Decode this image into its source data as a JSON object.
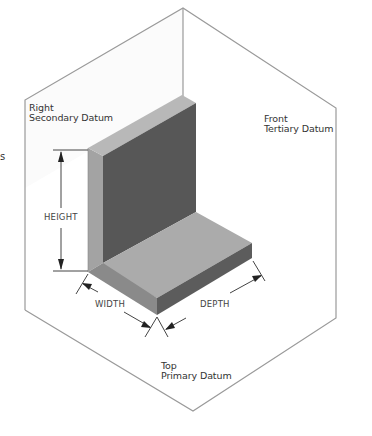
{
  "diagram": {
    "type": "isometric datum reference frame",
    "planes": [
      {
        "id": "right",
        "line1": "Right",
        "line2": "Secondary Datum"
      },
      {
        "id": "front",
        "line1": "Front",
        "line2": "Tertiary Datum"
      },
      {
        "id": "top",
        "line1": "Top",
        "line2": "Primary Datum"
      }
    ],
    "dimensions": {
      "height": "HEIGHT",
      "width": "WIDTH",
      "depth": "DEPTH"
    },
    "edge_fragment": "s",
    "colors": {
      "frame_line": "#9a9a9a",
      "top_face": "#b4b4b4",
      "side_face_light": "#a0a0a0",
      "dark_face": "#555555",
      "floor_top": "#ababab",
      "floor_front": "#7a7a7a",
      "floor_side": "#5a5a5a"
    }
  }
}
